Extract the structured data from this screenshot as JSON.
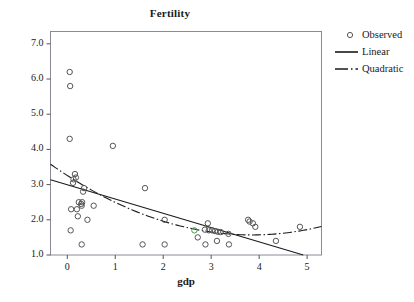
{
  "chart_data": {
    "type": "scatter",
    "title": "Fertility",
    "xlabel": "gdp",
    "ylabel": "",
    "xlim": [
      -0.35,
      5.3
    ],
    "ylim": [
      1.0,
      7.35
    ],
    "xticks": [
      "0",
      "1",
      "2",
      "3",
      "4",
      "5"
    ],
    "xtick_values": [
      0,
      1,
      2,
      3,
      4,
      5
    ],
    "yticks": [
      "1.0",
      "2.0",
      "3.0",
      "4.0",
      "5.0",
      "6.0",
      "7.0"
    ],
    "ytick_values": [
      1.0,
      2.0,
      3.0,
      4.0,
      5.0,
      6.0,
      7.0
    ],
    "grid": false,
    "legend_position": "right-top",
    "series": [
      {
        "name": "Observed",
        "type": "scatter",
        "marker": "open-circle",
        "color": "#555555",
        "points": [
          [
            0.05,
            6.2
          ],
          [
            0.06,
            5.8
          ],
          [
            0.05,
            4.3
          ],
          [
            0.95,
            4.1
          ],
          [
            0.16,
            3.3
          ],
          [
            0.18,
            3.2
          ],
          [
            0.13,
            3.15
          ],
          [
            0.12,
            3.05
          ],
          [
            0.35,
            2.9
          ],
          [
            1.62,
            2.9
          ],
          [
            0.33,
            2.8
          ],
          [
            0.24,
            2.5
          ],
          [
            0.31,
            2.5
          ],
          [
            0.29,
            2.45
          ],
          [
            0.3,
            2.4
          ],
          [
            0.55,
            2.4
          ],
          [
            0.08,
            2.3
          ],
          [
            0.2,
            2.3
          ],
          [
            0.22,
            2.1
          ],
          [
            0.42,
            2.0
          ],
          [
            2.03,
            2.0
          ],
          [
            2.93,
            1.9
          ],
          [
            3.77,
            2.0
          ],
          [
            3.8,
            1.95
          ],
          [
            3.87,
            1.9
          ],
          [
            3.92,
            1.8
          ],
          [
            4.85,
            1.8
          ],
          [
            2.65,
            1.7
          ],
          [
            2.87,
            1.72
          ],
          [
            2.95,
            1.7
          ],
          [
            3.02,
            1.7
          ],
          [
            3.08,
            1.68
          ],
          [
            3.14,
            1.66
          ],
          [
            3.2,
            1.65
          ],
          [
            3.36,
            1.6
          ],
          [
            0.07,
            1.7
          ],
          [
            2.72,
            1.5
          ],
          [
            4.35,
            1.4
          ],
          [
            3.12,
            1.4
          ],
          [
            0.3,
            1.3
          ],
          [
            1.57,
            1.3
          ],
          [
            2.03,
            1.3
          ],
          [
            2.88,
            1.3
          ],
          [
            3.37,
            1.3
          ]
        ],
        "highlighted_point": [
          2.65,
          1.7
        ],
        "highlighted_color": "#4a9a4a"
      },
      {
        "name": "Linear",
        "type": "line",
        "style": "solid",
        "color": "#1a1a1a",
        "fit": "y = 3.00 - 0.41 x",
        "endpoints": [
          [
            -0.35,
            3.14
          ],
          [
            4.92,
            1.0
          ]
        ]
      },
      {
        "name": "Quadratic",
        "type": "line",
        "style": "dash-dot",
        "color": "#1a1a1a",
        "fit": "y = 3.33 - 0.93 x + 0.12 x^2",
        "endpoints": [
          [
            -0.35,
            3.58
          ],
          [
            5.3,
            2.25
          ]
        ],
        "vertex": [
          3.85,
          1.57
        ]
      }
    ]
  },
  "legend": {
    "entries": [
      {
        "label": "Observed",
        "key": "open-circle-marker"
      },
      {
        "label": "Linear",
        "key": "solid-line"
      },
      {
        "label": "Quadratic",
        "key": "dash-dot-line"
      }
    ]
  }
}
